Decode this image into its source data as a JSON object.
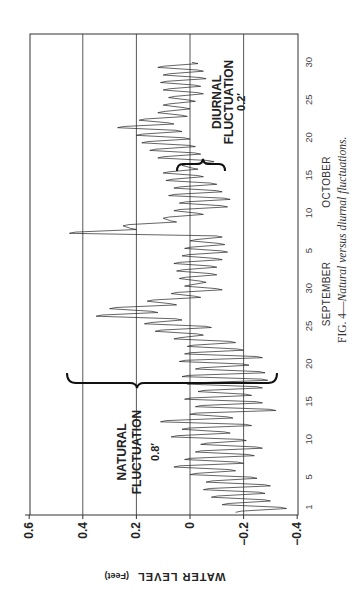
{
  "chart_data": {
    "type": "line",
    "title": "",
    "caption_prefix": "FIG. 4—",
    "caption_text": "Natural versus diurnal fluctuations.",
    "ylabel": "WATER LEVEL",
    "ylabel_unit": "(Feet)",
    "xlabel_months": [
      "SEPTEMBER",
      "OCTOBER"
    ],
    "ylim": [
      -0.4,
      0.6
    ],
    "yticks": [
      0.6,
      0.4,
      0.2,
      0,
      -0.2,
      -0.4
    ],
    "ytick_labels": [
      "0.6",
      "0.4",
      "0.2",
      "0",
      "−0.2",
      "−0.4"
    ],
    "grid": true,
    "orientation": "rotated 90° (time runs bottom-to-top, water level increases right-to-left)",
    "xticks": [
      {
        "t": 1,
        "label": "1",
        "month": "September"
      },
      {
        "t": 5,
        "label": "5",
        "month": "September"
      },
      {
        "t": 10,
        "label": "10",
        "month": "September"
      },
      {
        "t": 15,
        "label": "15",
        "month": "September"
      },
      {
        "t": 20,
        "label": "20",
        "month": "September"
      },
      {
        "t": 25,
        "label": "25",
        "month": "September"
      },
      {
        "t": 30,
        "label": "30",
        "month": "September"
      },
      {
        "t": 35,
        "label": "5",
        "month": "October"
      },
      {
        "t": 40,
        "label": "10",
        "month": "October"
      },
      {
        "t": 45,
        "label": "15",
        "month": "October"
      },
      {
        "t": 50,
        "label": "20",
        "month": "October"
      },
      {
        "t": 55,
        "label": "25",
        "month": "October"
      },
      {
        "t": 60,
        "label": "30",
        "month": "October"
      }
    ],
    "x_range_days": [
      0,
      63.7
    ],
    "series": [
      {
        "name": "Water level (ft), sampled approx. twice daily; t = day index (Sep 1 = 1, Oct 1 = 31)",
        "x": [
          0.3,
          0.8,
          1.3,
          1.8,
          2.3,
          2.8,
          3.3,
          3.8,
          4.3,
          4.8,
          5.3,
          5.8,
          6.3,
          6.8,
          7.3,
          7.8,
          8.3,
          8.8,
          9.3,
          9.8,
          10.3,
          10.8,
          11.3,
          11.8,
          12.3,
          12.8,
          13.3,
          13.8,
          14.3,
          14.8,
          15.3,
          15.8,
          16.3,
          16.8,
          17.3,
          17.8,
          18.3,
          18.8,
          19.3,
          19.8,
          20.3,
          20.8,
          21.3,
          21.8,
          22.3,
          22.8,
          23.3,
          23.8,
          24.3,
          24.8,
          25.3,
          25.8,
          26.3,
          26.8,
          27.3,
          27.8,
          28.3,
          28.8,
          29.3,
          29.8,
          30.3,
          30.8,
          31.3,
          31.8,
          32.3,
          32.8,
          33.3,
          33.8,
          34.3,
          34.8,
          35.3,
          35.8,
          36.3,
          36.8,
          37.3,
          37.8,
          38.3,
          38.8,
          39.3,
          39.8,
          40.3,
          40.8,
          41.3,
          41.8,
          42.3,
          42.8,
          43.3,
          43.8,
          44.3,
          44.8,
          45.3,
          45.8,
          46.3,
          46.8,
          47.3,
          47.8,
          48.3,
          48.8,
          49.3,
          49.8,
          50.3,
          50.8,
          51.3,
          51.8,
          52.3,
          52.8,
          53.3,
          53.8,
          54.3,
          54.8,
          55.3,
          55.8,
          56.3,
          56.8,
          57.3,
          57.8,
          58.3,
          58.8,
          59.3,
          59.8
        ],
        "values": [
          -0.17,
          -0.36,
          -0.12,
          -0.3,
          -0.08,
          -0.28,
          -0.05,
          -0.3,
          -0.06,
          -0.25,
          0.0,
          -0.17,
          0.06,
          -0.2,
          0.02,
          -0.24,
          -0.02,
          -0.27,
          -0.04,
          -0.21,
          0.07,
          -0.15,
          0.03,
          -0.23,
          0.11,
          -0.16,
          0.0,
          -0.32,
          -0.02,
          -0.27,
          0.02,
          -0.23,
          -0.03,
          -0.27,
          0.01,
          -0.29,
          0.03,
          -0.28,
          -0.02,
          -0.22,
          0.04,
          -0.27,
          0.02,
          -0.2,
          0.01,
          -0.17,
          0.06,
          -0.05,
          0.13,
          -0.08,
          0.17,
          0.03,
          0.35,
          0.12,
          0.3,
          0.05,
          0.16,
          -0.04,
          0.07,
          -0.12,
          0.02,
          -0.06,
          0.04,
          -0.1,
          0.05,
          -0.1,
          0.06,
          -0.12,
          0.03,
          -0.14,
          0.02,
          -0.13,
          0.0,
          -0.12,
          0.45,
          0.2,
          0.25,
          0.05,
          0.1,
          -0.05,
          0.06,
          -0.14,
          0.04,
          -0.15,
          0.08,
          -0.12,
          0.06,
          -0.1,
          0.09,
          -0.05,
          0.1,
          -0.03,
          0.03,
          -0.09,
          0.12,
          -0.04,
          0.15,
          -0.02,
          0.18,
          0.0,
          0.2,
          0.03,
          0.27,
          0.06,
          0.19,
          0.01,
          0.12,
          0.0,
          0.1,
          -0.02,
          0.08,
          -0.05,
          0.1,
          -0.04,
          0.11,
          -0.06,
          0.1,
          -0.05,
          0.12,
          -0.03
        ]
      }
    ],
    "annotations": [
      {
        "text": [
          "NATURAL",
          "FLUCTUATION",
          "0.8′"
        ],
        "type": "brace",
        "span_value": [
          -0.33,
          0.46
        ],
        "at_day": 15.9
      },
      {
        "text": [
          "DIURNAL",
          "FLUCTUATION",
          "0.2′"
        ],
        "type": "brace",
        "span_value": [
          -0.13,
          0.05
        ],
        "at_day": 47.3
      }
    ]
  },
  "labels": {
    "natural": [
      "NATURAL",
      "FLUCTUATION",
      "0.8′"
    ],
    "diurnal": [
      "DIURNAL",
      "FLUCTUATION",
      "0.2′"
    ],
    "month_sep": "SEPTEMBER",
    "month_oct": "OCTOBER",
    "ylabel": "WATER LEVEL",
    "ylabel_unit": "(Feet)",
    "caption_prefix": "FIG. 4—",
    "caption_text": "Natural versus diurnal fluctuations."
  }
}
